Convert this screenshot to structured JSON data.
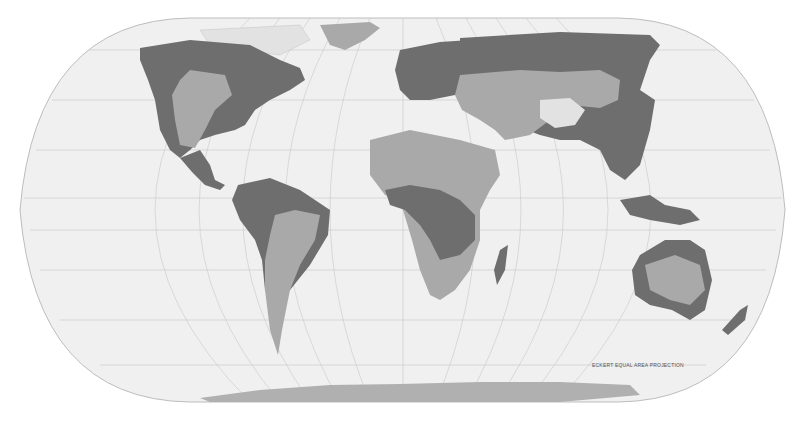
{
  "map": {
    "projection_label": "ECKERT EQUAL AREA PROJECTION",
    "colors": {
      "ocean": "#f0f0f0",
      "outline": "#bdbdbd",
      "graticule": "#c8c8c8",
      "class_dark": "#6e6e6e",
      "class_medium": "#a9a9a9",
      "class_light": "#e2e2e2",
      "antarctica": "#b0b0b0"
    },
    "regions": [
      {
        "name": "North America",
        "shade": "mixed"
      },
      {
        "name": "Greenland",
        "shade": "medium"
      },
      {
        "name": "South America",
        "shade": "mixed"
      },
      {
        "name": "Europe",
        "shade": "dark"
      },
      {
        "name": "Africa",
        "shade": "mixed"
      },
      {
        "name": "Asia",
        "shade": "mixed"
      },
      {
        "name": "Australia",
        "shade": "mixed"
      },
      {
        "name": "Antarctica",
        "shade": "medium"
      }
    ]
  }
}
